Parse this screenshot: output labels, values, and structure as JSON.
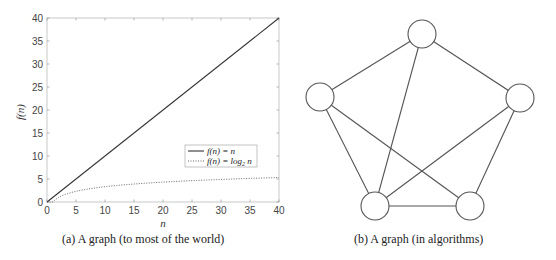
{
  "chart_data": [
    {
      "type": "line",
      "title": "",
      "xlabel": "n",
      "ylabel": "f(n)",
      "xlim": [
        0,
        40
      ],
      "ylim": [
        0,
        40
      ],
      "xticks": [
        0,
        5,
        10,
        15,
        20,
        25,
        30,
        35,
        40
      ],
      "yticks": [
        0,
        5,
        10,
        15,
        20,
        25,
        30,
        35,
        40
      ],
      "grid": false,
      "legend_position": "lower right",
      "series": [
        {
          "name": "f(n) = n",
          "style": "solid",
          "x": [
            0,
            40
          ],
          "y": [
            0,
            40
          ]
        },
        {
          "name": "f(n) = log2 n",
          "style": "dotted",
          "x": [
            1,
            2,
            4,
            8,
            16,
            32,
            40
          ],
          "y": [
            0,
            1,
            2,
            3,
            4,
            5,
            5.32
          ]
        }
      ]
    },
    {
      "type": "graph",
      "nodes": [
        "top",
        "left",
        "right",
        "bottom-left",
        "bottom-right"
      ],
      "edges": [
        [
          "top",
          "left"
        ],
        [
          "top",
          "right"
        ],
        [
          "top",
          "bottom-left"
        ],
        [
          "left",
          "bottom-left"
        ],
        [
          "left",
          "bottom-right"
        ],
        [
          "right",
          "bottom-left"
        ],
        [
          "right",
          "bottom-right"
        ],
        [
          "bottom-left",
          "bottom-right"
        ]
      ]
    }
  ],
  "plot": {
    "xlabel": "n",
    "ylabel": "f(n)",
    "x_ticks": [
      "0",
      "5",
      "10",
      "15",
      "20",
      "25",
      "30",
      "35",
      "40"
    ],
    "y_ticks": [
      "0",
      "5",
      "10",
      "15",
      "20",
      "25",
      "30",
      "35",
      "40"
    ],
    "legend": {
      "linear": "f(n) = n",
      "log_prefix": "f(n) = log",
      "log_sub": "2",
      "log_suffix": " n"
    }
  },
  "captions": {
    "left": "(a)  A graph (to most of the world)",
    "right": "(b)  A graph (in algorithms)"
  }
}
